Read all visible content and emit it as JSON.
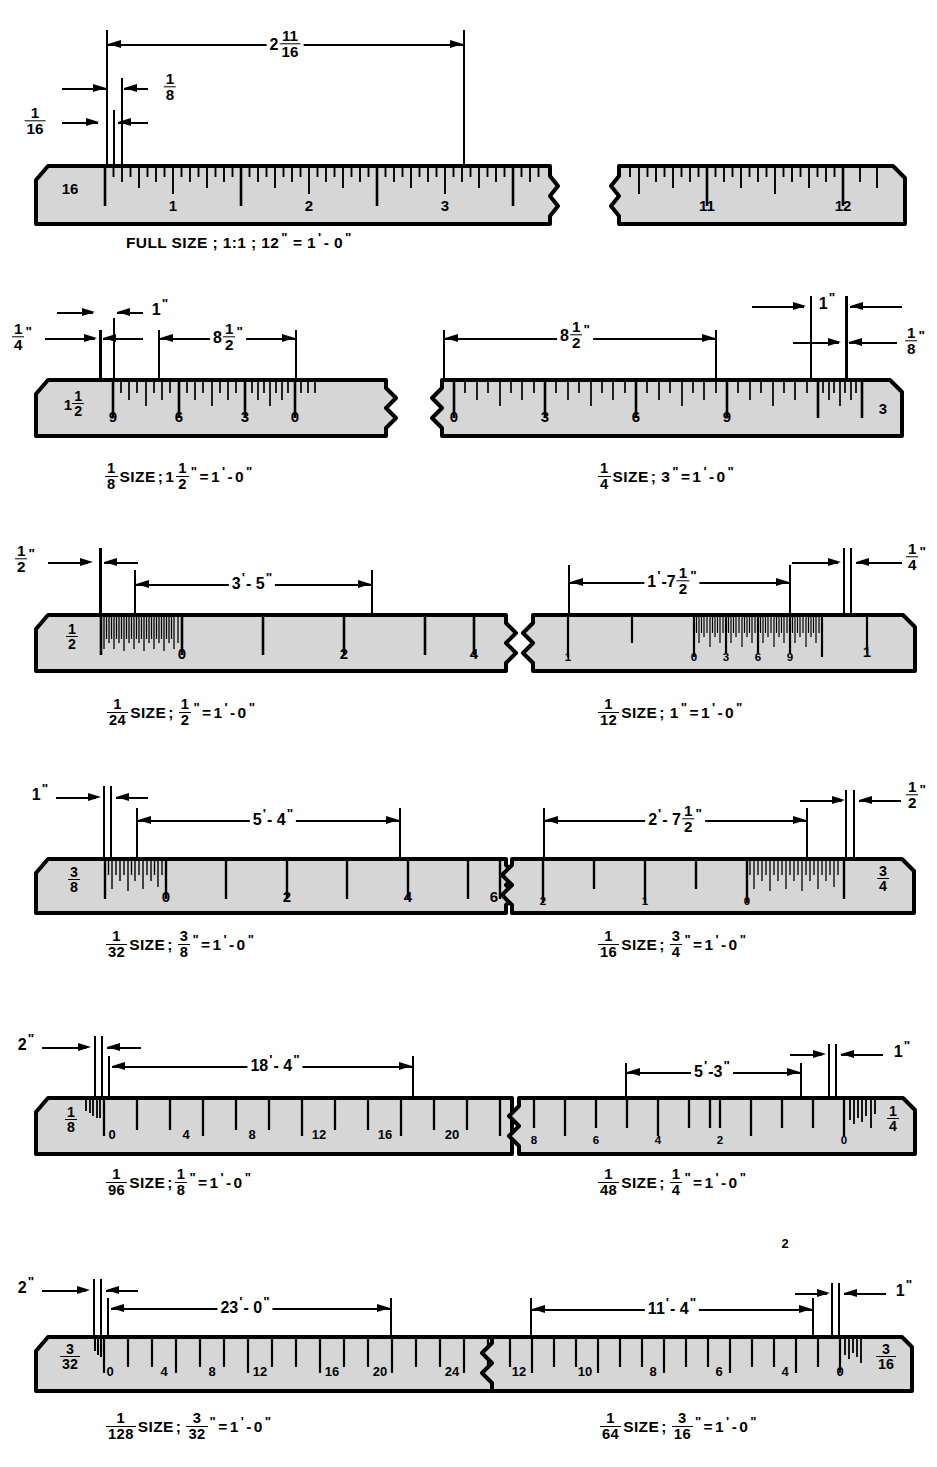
{
  "figure": {
    "ruler_fill": "#d6d6d6",
    "ruler_stroke": "#000000",
    "background": "#ffffff"
  },
  "rows": [
    {
      "id": "full-size",
      "caption_plain": "FULL SIZE ; 1:1 ; 12\" = 1'- 0\"",
      "caption_parts": [
        "FULL SIZE ; 1:1 ; 12",
        "\"",
        "= 1",
        "'",
        "- 0",
        "\""
      ],
      "scales": [
        {
          "id": "full-left",
          "end_label": "16",
          "end_label_kind": "plain",
          "numbers": [
            "1",
            "2",
            "3"
          ],
          "direction": "left-to-right"
        },
        {
          "id": "full-right",
          "numbers": [
            "11",
            "12"
          ],
          "direction": "left-to-right"
        }
      ],
      "dimensions": [
        {
          "id": "dim-2-11-16",
          "text": "2 11/16",
          "whole": "2",
          "num": "11",
          "den": "16"
        },
        {
          "id": "dim-1-8",
          "text": "1/8",
          "num": "1",
          "den": "8"
        },
        {
          "id": "dim-1-16",
          "text": "1/16",
          "num": "1",
          "den": "16"
        }
      ]
    },
    {
      "id": "eighth-and-quarter",
      "scales": [
        {
          "id": "one-eighth-size",
          "end_label_num": "1 1/2",
          "numbers": [
            "9",
            "6",
            "3",
            "0"
          ],
          "caption_prefix_num": "1",
          "caption_prefix_den": "8",
          "caption_text": "SIZE ; 1 1/2\" = 1'- 0\"",
          "dimensions": [
            {
              "id": "dim-1in",
              "text": "1\""
            },
            {
              "id": "dim-1-4in",
              "text": "1/4\"",
              "num": "1",
              "den": "4"
            },
            {
              "id": "dim-8-1-2in",
              "text": "8 1/2\"",
              "whole": "8",
              "num": "1",
              "den": "2"
            }
          ]
        },
        {
          "id": "one-quarter-size",
          "end_label": "3",
          "numbers": [
            "0",
            "3",
            "6",
            "9"
          ],
          "caption_prefix_num": "1",
          "caption_prefix_den": "4",
          "caption_text": "SIZE; 3\"= 1'- 0\"",
          "dimensions": [
            {
              "id": "dim-8-1-2in",
              "text": "8 1/2\"",
              "whole": "8",
              "num": "1",
              "den": "2"
            },
            {
              "id": "dim-1in",
              "text": "1\""
            },
            {
              "id": "dim-1-8in",
              "text": "1/8\"",
              "num": "1",
              "den": "8"
            }
          ]
        }
      ]
    },
    {
      "id": "twentyfourth-and-twelfth",
      "scales": [
        {
          "id": "one-twentyfourth-size",
          "end_label_num": "1",
          "end_label_den": "2",
          "numbers": [
            "0",
            "2",
            "4"
          ],
          "caption_prefix_num": "1",
          "caption_prefix_den": "24",
          "caption_text": "SIZE ; 1/2\" = 1'- 0\"",
          "dimensions": [
            {
              "id": "dim-1-2in",
              "text": "1/2\"",
              "num": "1",
              "den": "2"
            },
            {
              "id": "dim-3ft-5in",
              "text": "3'- 5\""
            }
          ]
        },
        {
          "id": "one-twelfth-size",
          "end_label": "1",
          "numbers": [
            "1",
            "0",
            "3",
            "6",
            "9",
            "1"
          ],
          "caption_prefix_num": "1",
          "caption_prefix_den": "12",
          "caption_text": "SIZE; 1\"= 1'- 0\"",
          "dimensions": [
            {
              "id": "dim-1ft-7-1-2in",
              "text": "1'-7 1/2\"",
              "lead": "1'-7",
              "num": "1",
              "den": "2"
            },
            {
              "id": "dim-1-4in",
              "text": "1/4\"",
              "num": "1",
              "den": "4"
            }
          ]
        }
      ]
    },
    {
      "id": "thirtysecond-and-sixteenth",
      "scales": [
        {
          "id": "one-thirtysecond-size",
          "end_label_num": "3",
          "end_label_den": "8",
          "numbers": [
            "0",
            "2",
            "4",
            "6"
          ],
          "caption_prefix_num": "1",
          "caption_prefix_den": "32",
          "caption_text": "SIZE ; 3/8\" = 1'- 0\"",
          "dimensions": [
            {
              "id": "dim-1in",
              "text": "1\""
            },
            {
              "id": "dim-5ft-4in",
              "text": "5'- 4\""
            }
          ]
        },
        {
          "id": "one-sixteenth-size",
          "end_label_num": "3",
          "end_label_den": "4",
          "numbers": [
            "2",
            "1",
            "0"
          ],
          "caption_prefix_num": "1",
          "caption_prefix_den": "16",
          "caption_text": "SIZE ; 3/4\" = 1'- 0\"",
          "dimensions": [
            {
              "id": "dim-2ft-7-1-2in",
              "text": "2'-7 1/2\"",
              "lead": "2'- 7",
              "num": "1",
              "den": "2"
            },
            {
              "id": "dim-1-2in",
              "text": "1/2\"",
              "num": "1",
              "den": "2"
            }
          ]
        }
      ]
    },
    {
      "id": "ninetysixth-and-fortyeighth",
      "scales": [
        {
          "id": "one-ninetysixth-size",
          "end_label_num": "1",
          "end_label_den": "8",
          "numbers": [
            "0",
            "4",
            "8",
            "12",
            "16",
            "20"
          ],
          "caption_prefix_num": "1",
          "caption_prefix_den": "96",
          "caption_text": "SIZE; 1/8\" = 1'- 0\"",
          "dimensions": [
            {
              "id": "dim-2in",
              "text": "2\""
            },
            {
              "id": "dim-18ft-4in",
              "text": "18'- 4\""
            }
          ]
        },
        {
          "id": "one-fortyeighth-size",
          "end_label_num": "1",
          "end_label_den": "4",
          "numbers": [
            "8",
            "6",
            "4",
            "2",
            "0"
          ],
          "caption_prefix_num": "1",
          "caption_prefix_den": "48",
          "caption_text": "SIZE ; 1/4\" = 1'- 0\"",
          "dimensions": [
            {
              "id": "dim-5ft-3in",
              "text": "5'- 3\""
            },
            {
              "id": "dim-1in",
              "text": "1\""
            }
          ]
        }
      ]
    },
    {
      "id": "onetwentyeighth-and-sixtyfourth",
      "scales": [
        {
          "id": "one-onetwentyeighth-size",
          "end_label_num": "3",
          "end_label_den": "32",
          "numbers": [
            "0",
            "4",
            "8",
            "12",
            "16",
            "20",
            "24",
            "28"
          ],
          "caption_prefix_num": "1",
          "caption_prefix_den": "128",
          "caption_text": "SIZE ; 3/32\" = 1'- 0\"",
          "dimensions": [
            {
              "id": "dim-2in",
              "text": "2\""
            },
            {
              "id": "dim-23ft-0in",
              "text": "23'- 0\""
            }
          ]
        },
        {
          "id": "one-sixtyfourth-size",
          "end_label_num": "3",
          "end_label_den": "16",
          "numbers": [
            "12",
            "10",
            "8",
            "6",
            "4",
            "2",
            "0"
          ],
          "caption_prefix_num": "1",
          "caption_prefix_den": "64",
          "caption_text": "SIZE ; 3/16\" = 1'- 0\"",
          "dimensions": [
            {
              "id": "dim-11ft-4in",
              "text": "11'- 4\""
            },
            {
              "id": "dim-1in",
              "text": "1\""
            }
          ]
        }
      ]
    }
  ],
  "labels": {
    "size_word": "SIZE",
    "semicolon": ";",
    "equals": "=",
    "inch_mark": "\"",
    "foot_mark": "'",
    "dash": "-",
    "zero": "0",
    "one": "1",
    "full_size": "FULL SIZE",
    "ratio_1_1": "1:1",
    "twelve": "12",
    "one_ft_zero_in": "1'- 0\""
  }
}
